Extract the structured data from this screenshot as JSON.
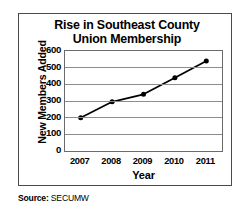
{
  "chart_data": {
    "type": "line",
    "title": "Rise in Southeast County Union Membership",
    "title_lines": [
      "Rise in Southeast County",
      "Union Membership"
    ],
    "xlabel": "Year",
    "ylabel": "New Members Added",
    "categories": [
      "2007",
      "2008",
      "2009",
      "2010",
      "2011"
    ],
    "values": [
      200,
      295,
      340,
      440,
      540
    ],
    "series": [
      {
        "name": "New Members Added",
        "values": [
          200,
          295,
          340,
          440,
          540
        ]
      }
    ],
    "ylim": [
      0,
      600
    ],
    "yticks": [
      0,
      100,
      200,
      300,
      400,
      500,
      600
    ],
    "ytick_labels": [
      "0",
      "100",
      "200",
      "300",
      "400",
      "500",
      "600"
    ],
    "xtick_labels": [
      "2007",
      "2008",
      "2009",
      "2010",
      "2011"
    ],
    "grid": true,
    "grid_axis": "y",
    "legend": false,
    "legend_position": "none",
    "marker": "filled-circle",
    "line_color": "#000000",
    "marker_color": "#000000",
    "grid_color": "#8d8d8d",
    "plot_border_color": "#6b6b6b",
    "frame_color": "#4a4a4a",
    "background_color": "#ffffff"
  },
  "source": {
    "label": "Source:",
    "value": "SECUMW"
  }
}
